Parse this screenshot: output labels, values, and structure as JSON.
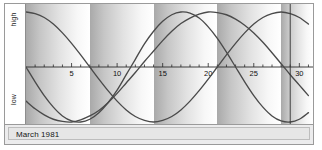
{
  "window": {
    "title": "Biorhythm Chart"
  },
  "axis": {
    "y_top_label": "high",
    "y_bottom_label": "low",
    "tick_labels": [
      "5",
      "10",
      "15",
      "20",
      "25",
      "30"
    ],
    "tick_values": [
      5,
      10,
      15,
      20,
      25,
      30
    ]
  },
  "footer": {
    "month_label": "March 1981"
  },
  "colors": {
    "curve": "#4a4a4a",
    "axis": "#2a2a2a",
    "today_marker": "#333333",
    "frame": "#9a9a9a",
    "footer_bg": "#e6e6e6",
    "band_dark": "#a9a9a9",
    "band_light": "#ffffff"
  },
  "chart_data": {
    "type": "line",
    "title": "March 1981",
    "xlabel": "",
    "ylabel": "",
    "xlim": [
      0,
      31.5
    ],
    "ylim": [
      -1,
      1
    ],
    "grid": false,
    "legend": "none",
    "x_tick_labels": [
      "5",
      "10",
      "15",
      "20",
      "25",
      "30"
    ],
    "x_ticks_major": [
      5,
      10,
      15,
      20,
      25,
      30
    ],
    "x_ticks_minor_step": 1,
    "y_tick_labels": [
      "high",
      "low"
    ],
    "band_period_days": 7,
    "band_start_day": 0,
    "annotations": [
      {
        "name": "today-marker",
        "type": "vline",
        "x": 29.0
      }
    ],
    "series": [
      {
        "name": "physical",
        "period_days": 23,
        "phase_day": 11.5,
        "amplitude": 1.0,
        "start_value": 0.0,
        "points": [
          {
            "x": 0,
            "y": 0.0
          },
          {
            "x": 1,
            "y": -0.27
          },
          {
            "x": 2,
            "y": -0.52
          },
          {
            "x": 3,
            "y": -0.73
          },
          {
            "x": 4,
            "y": -0.89
          },
          {
            "x": 5,
            "y": -0.98
          },
          {
            "x": 6,
            "y": -1.0
          },
          {
            "x": 7,
            "y": -0.95
          },
          {
            "x": 8,
            "y": -0.83
          },
          {
            "x": 9,
            "y": -0.65
          },
          {
            "x": 10,
            "y": -0.42
          },
          {
            "x": 11,
            "y": -0.14
          },
          {
            "x": 12,
            "y": 0.14
          },
          {
            "x": 13,
            "y": 0.42
          },
          {
            "x": 14,
            "y": 0.65
          },
          {
            "x": 15,
            "y": 0.83
          },
          {
            "x": 16,
            "y": 0.95
          },
          {
            "x": 17,
            "y": 1.0
          },
          {
            "x": 18,
            "y": 0.98
          },
          {
            "x": 19,
            "y": 0.89
          },
          {
            "x": 20,
            "y": 0.73
          },
          {
            "x": 21,
            "y": 0.52
          },
          {
            "x": 22,
            "y": 0.27
          },
          {
            "x": 23,
            "y": 0.0
          },
          {
            "x": 24,
            "y": -0.27
          },
          {
            "x": 25,
            "y": -0.52
          },
          {
            "x": 26,
            "y": -0.73
          },
          {
            "x": 27,
            "y": -0.89
          },
          {
            "x": 28,
            "y": -0.98
          },
          {
            "x": 29,
            "y": -1.0
          },
          {
            "x": 30,
            "y": -0.95
          },
          {
            "x": 31,
            "y": -0.83
          }
        ]
      },
      {
        "name": "emotional",
        "period_days": 28,
        "phase_day": 0,
        "amplitude": 1.0,
        "start_value": 1.0,
        "points": [
          {
            "x": 0,
            "y": 1.0
          },
          {
            "x": 1,
            "y": 0.97
          },
          {
            "x": 2,
            "y": 0.9
          },
          {
            "x": 3,
            "y": 0.78
          },
          {
            "x": 4,
            "y": 0.62
          },
          {
            "x": 5,
            "y": 0.43
          },
          {
            "x": 6,
            "y": 0.22
          },
          {
            "x": 7,
            "y": 0.0
          },
          {
            "x": 8,
            "y": -0.22
          },
          {
            "x": 9,
            "y": -0.43
          },
          {
            "x": 10,
            "y": -0.62
          },
          {
            "x": 11,
            "y": -0.78
          },
          {
            "x": 12,
            "y": -0.9
          },
          {
            "x": 13,
            "y": -0.97
          },
          {
            "x": 14,
            "y": -1.0
          },
          {
            "x": 15,
            "y": -0.97
          },
          {
            "x": 16,
            "y": -0.9
          },
          {
            "x": 17,
            "y": -0.78
          },
          {
            "x": 18,
            "y": -0.62
          },
          {
            "x": 19,
            "y": -0.43
          },
          {
            "x": 20,
            "y": -0.22
          },
          {
            "x": 21,
            "y": 0.0
          },
          {
            "x": 22,
            "y": 0.22
          },
          {
            "x": 23,
            "y": 0.43
          },
          {
            "x": 24,
            "y": 0.62
          },
          {
            "x": 25,
            "y": 0.78
          },
          {
            "x": 26,
            "y": 0.9
          },
          {
            "x": 27,
            "y": 0.97
          },
          {
            "x": 28,
            "y": 1.0
          },
          {
            "x": 29,
            "y": 0.97
          },
          {
            "x": 30,
            "y": 0.9
          },
          {
            "x": 31,
            "y": 0.78
          }
        ]
      },
      {
        "name": "intellectual",
        "period_days": 33,
        "phase_day": 20.0,
        "amplitude": 1.0,
        "start_value": -0.62,
        "points": [
          {
            "x": 0,
            "y": -0.62
          },
          {
            "x": 1,
            "y": -0.76
          },
          {
            "x": 2,
            "y": -0.87
          },
          {
            "x": 3,
            "y": -0.95
          },
          {
            "x": 4,
            "y": -0.99
          },
          {
            "x": 5,
            "y": -1.0
          },
          {
            "x": 6,
            "y": -0.96
          },
          {
            "x": 7,
            "y": -0.89
          },
          {
            "x": 8,
            "y": -0.79
          },
          {
            "x": 9,
            "y": -0.65
          },
          {
            "x": 10,
            "y": -0.48
          },
          {
            "x": 11,
            "y": -0.29
          },
          {
            "x": 12,
            "y": -0.1
          },
          {
            "x": 13,
            "y": 0.1
          },
          {
            "x": 14,
            "y": 0.29
          },
          {
            "x": 15,
            "y": 0.48
          },
          {
            "x": 16,
            "y": 0.65
          },
          {
            "x": 17,
            "y": 0.79
          },
          {
            "x": 18,
            "y": 0.89
          },
          {
            "x": 19,
            "y": 0.96
          },
          {
            "x": 20,
            "y": 1.0
          },
          {
            "x": 21,
            "y": 0.99
          },
          {
            "x": 22,
            "y": 0.95
          },
          {
            "x": 23,
            "y": 0.87
          },
          {
            "x": 24,
            "y": 0.76
          },
          {
            "x": 25,
            "y": 0.62
          },
          {
            "x": 26,
            "y": 0.45
          },
          {
            "x": 27,
            "y": 0.26
          },
          {
            "x": 28,
            "y": 0.06
          },
          {
            "x": 29,
            "y": -0.14
          },
          {
            "x": 30,
            "y": -0.33
          },
          {
            "x": 31,
            "y": -0.52
          }
        ]
      }
    ]
  }
}
